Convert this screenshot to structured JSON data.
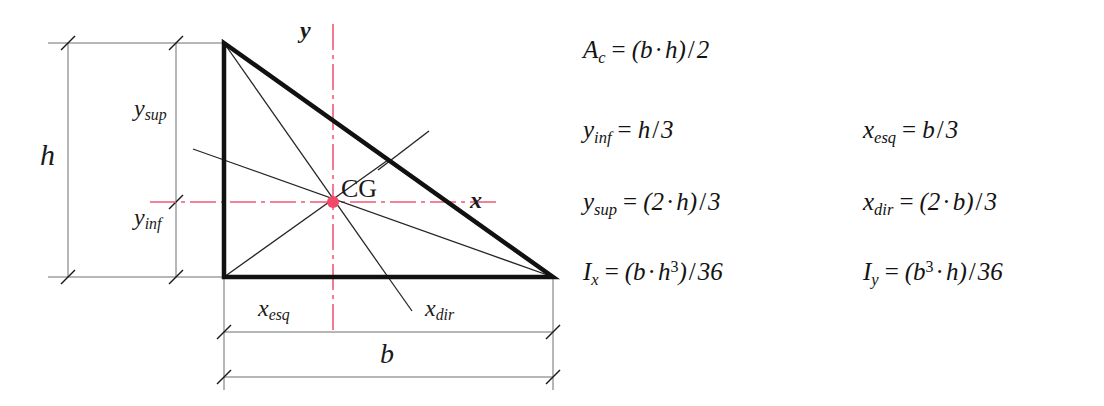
{
  "diagram": {
    "shape_name": "right-triangle",
    "centroid_label": "CG",
    "axis_x_label": "x",
    "axis_y_label": "y",
    "dim_h": "h",
    "dim_b": "b",
    "dim_y_sup": {
      "base": "y",
      "sub": "sup"
    },
    "dim_y_inf": {
      "base": "y",
      "sub": "inf"
    },
    "dim_x_esq": {
      "base": "x",
      "sub": "esq"
    },
    "dim_x_dir": {
      "base": "x",
      "sub": "dir"
    },
    "colors": {
      "axis": "#ef5a78",
      "centroid_dot": "#f04a68",
      "outline": "#111111",
      "median": "#222222",
      "dimension": "#555555"
    },
    "geometry": {
      "apex_top_left": [
        224,
        43
      ],
      "corner_bottom_left": [
        224,
        277
      ],
      "corner_bottom_right": [
        553,
        277
      ],
      "centroid": [
        333,
        199
      ],
      "width_b_px": 329,
      "height_h_px": 234
    }
  },
  "formulas": {
    "rows": [
      {
        "left": {
          "lhs_var": "A",
          "lhs_sub": "c",
          "rhs_parts": [
            "(",
            "b",
            "·",
            "h",
            ")",
            "/",
            "2"
          ],
          "plain": "A_c = (b · h) / 2"
        },
        "right": null
      },
      {
        "left": {
          "lhs_var": "y",
          "lhs_sub": "inf",
          "rhs_parts": [
            "h",
            "/",
            "3"
          ],
          "plain": "y_inf = h / 3"
        },
        "right": {
          "lhs_var": "x",
          "lhs_sub": "esq",
          "rhs_parts": [
            "b",
            "/",
            "3"
          ],
          "plain": "x_esq = b / 3"
        }
      },
      {
        "left": {
          "lhs_var": "y",
          "lhs_sub": "sup",
          "rhs_parts": [
            "(",
            "2",
            "·",
            "h",
            ")",
            "/",
            "3"
          ],
          "plain": "y_sup = (2 · h) / 3"
        },
        "right": {
          "lhs_var": "x",
          "lhs_sub": "dir",
          "rhs_parts": [
            "(",
            "2",
            "·",
            "b",
            ")",
            "/",
            "3"
          ],
          "plain": "x_dir = (2 · b) / 3"
        }
      },
      {
        "left": {
          "lhs_var": "I",
          "lhs_sub": "x",
          "rhs_parts": [
            "(",
            "b",
            "·",
            "h",
            "3",
            ")",
            "/",
            "36"
          ],
          "plain": "I_x = (b · h^3) / 36"
        },
        "right": {
          "lhs_var": "I",
          "lhs_sub": "y",
          "rhs_parts": [
            "(",
            "b",
            "3",
            "·",
            "h",
            ")",
            "/",
            "36"
          ],
          "plain": "I_y = (b^3 · h) / 36"
        }
      }
    ],
    "equals_sign": "=",
    "multiply_sign": "·",
    "divide_sign": "/",
    "f0_lhs_base": "A",
    "f0_lhs_sub": "c",
    "f0_open": "(",
    "f0_b": "b",
    "f0_dot": "·",
    "f0_h": "h",
    "f0_close": ")",
    "f0_slash": "/",
    "f0_two": "2",
    "f1l_lhs_base": "y",
    "f1l_lhs_sub": "inf",
    "f1l_h": "h",
    "f1l_slash": "/",
    "f1l_three": "3",
    "f1r_lhs_base": "x",
    "f1r_lhs_sub": "esq",
    "f1r_b": "b",
    "f1r_slash": "/",
    "f1r_three": "3",
    "f2l_lhs_base": "y",
    "f2l_lhs_sub": "sup",
    "f2l_open": "(",
    "f2l_two": "2",
    "f2l_dot": "·",
    "f2l_h": "h",
    "f2l_close": ")",
    "f2l_slash": "/",
    "f2l_three": "3",
    "f2r_lhs_base": "x",
    "f2r_lhs_sub": "dir",
    "f2r_open": "(",
    "f2r_two": "2",
    "f2r_dot": "·",
    "f2r_b": "b",
    "f2r_close": ")",
    "f2r_slash": "/",
    "f2r_three": "3",
    "f3l_lhs_base": "I",
    "f3l_lhs_sub": "x",
    "f3l_open": "(",
    "f3l_b": "b",
    "f3l_dot": "·",
    "f3l_h": "h",
    "f3l_exp": "3",
    "f3l_close": ")",
    "f3l_slash": "/",
    "f3l_36": "36",
    "f3r_lhs_base": "I",
    "f3r_lhs_sub": "y",
    "f3r_open": "(",
    "f3r_b": "b",
    "f3r_exp": "3",
    "f3r_dot": "·",
    "f3r_h": "h",
    "f3r_close": ")",
    "f3r_slash": "/",
    "f3r_36": "36"
  }
}
